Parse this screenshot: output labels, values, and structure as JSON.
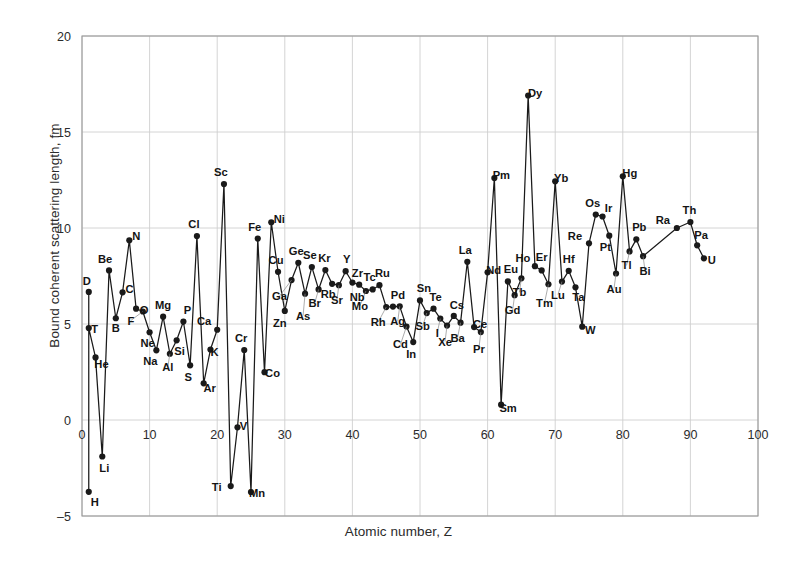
{
  "chart_data": {
    "type": "line",
    "title": "",
    "xlabel": "Atomic number, Z",
    "ylabel": "Bound coherent scattering length, fm",
    "xlim": [
      0,
      100
    ],
    "ylim": [
      -5,
      20
    ],
    "xticks": [
      0,
      10,
      20,
      30,
      40,
      50,
      60,
      70,
      80,
      90,
      100
    ],
    "yticks": [
      -5,
      0,
      5,
      10,
      15,
      20
    ],
    "grid": true,
    "legend": "none",
    "marker": "filled-circle",
    "line_color": "#1a1a1a",
    "grid_color": "#cfcfcf",
    "axis_color": "#9a9a9a",
    "series": [
      {
        "name": "Bound coherent scattering length",
        "points": [
          {
            "label": "H",
            "x": 1,
            "y": -3.74,
            "lx": 6,
            "ly": 14
          },
          {
            "label": "D",
            "x": 1,
            "y": 6.67,
            "lx": -2,
            "ly": -7
          },
          {
            "label": "T",
            "x": 1,
            "y": 4.79,
            "lx": 6,
            "ly": 5
          },
          {
            "label": "He",
            "x": 2,
            "y": 3.26,
            "lx": 6,
            "ly": 11
          },
          {
            "label": "Li",
            "x": 3,
            "y": -1.9,
            "lx": 2,
            "ly": 16
          },
          {
            "label": "Be",
            "x": 4,
            "y": 7.79,
            "lx": -4,
            "ly": -7
          },
          {
            "label": "B",
            "x": 5,
            "y": 5.3,
            "lx": 0,
            "ly": 14
          },
          {
            "label": "C",
            "x": 6,
            "y": 6.65,
            "lx": 7,
            "ly": 1
          },
          {
            "label": "N",
            "x": 7,
            "y": 9.36,
            "lx": 7,
            "ly": 0
          },
          {
            "label": "O",
            "x": 8,
            "y": 5.8,
            "lx": 8,
            "ly": 5
          },
          {
            "label": "F",
            "x": 9,
            "y": 5.65,
            "lx": -12,
            "ly": 13
          },
          {
            "label": "Ne",
            "x": 10,
            "y": 4.57,
            "lx": -2,
            "ly": 15
          },
          {
            "label": "Na",
            "x": 11,
            "y": 3.63,
            "lx": -6,
            "ly": 15
          },
          {
            "label": "Mg",
            "x": 12,
            "y": 5.38,
            "lx": 0,
            "ly": -8
          },
          {
            "label": "Al",
            "x": 13,
            "y": 3.45,
            "lx": -2,
            "ly": 17
          },
          {
            "label": "Si",
            "x": 14,
            "y": 4.15,
            "lx": 3,
            "ly": 15
          },
          {
            "label": "P",
            "x": 15,
            "y": 5.13,
            "lx": 4,
            "ly": -8
          },
          {
            "label": "S",
            "x": 16,
            "y": 2.85,
            "lx": -2,
            "ly": 16
          },
          {
            "label": "Cl",
            "x": 17,
            "y": 9.58,
            "lx": -3,
            "ly": -8
          },
          {
            "label": "Ar",
            "x": 18,
            "y": 1.91,
            "lx": 6,
            "ly": 9
          },
          {
            "label": "K",
            "x": 19,
            "y": 3.67,
            "lx": 4,
            "ly": 6
          },
          {
            "label": "Ca",
            "x": 20,
            "y": 4.7,
            "lx": -13,
            "ly": -5
          },
          {
            "label": "Sc",
            "x": 21,
            "y": 12.29,
            "lx": -3,
            "ly": -8
          },
          {
            "label": "Ti",
            "x": 22,
            "y": -3.44,
            "lx": -14,
            "ly": 5
          },
          {
            "label": "V",
            "x": 23,
            "y": -0.38,
            "lx": 6,
            "ly": 3
          },
          {
            "label": "Cr",
            "x": 24,
            "y": 3.64,
            "lx": -3,
            "ly": -8
          },
          {
            "label": "Mn",
            "x": 25,
            "y": -3.75,
            "lx": 6,
            "ly": 5
          },
          {
            "label": "Fe",
            "x": 26,
            "y": 9.45,
            "lx": -3,
            "ly": -8
          },
          {
            "label": "Co",
            "x": 27,
            "y": 2.49,
            "lx": 8,
            "ly": 5
          },
          {
            "label": "Ni",
            "x": 28,
            "y": 10.3,
            "lx": 8,
            "ly": 1
          },
          {
            "label": "Cu",
            "x": 29,
            "y": 7.72,
            "lx": -2,
            "ly": -8
          },
          {
            "label": "Zn",
            "x": 30,
            "y": 5.68,
            "lx": -5,
            "ly": 16
          },
          {
            "label": "Ga",
            "x": 31,
            "y": 7.29,
            "lx": -12,
            "ly": 20
          },
          {
            "label": "Ge",
            "x": 32,
            "y": 8.19,
            "lx": -2,
            "ly": -8
          },
          {
            "label": "As",
            "x": 33,
            "y": 6.58,
            "lx": -2,
            "ly": 26
          },
          {
            "label": "Se",
            "x": 34,
            "y": 7.97,
            "lx": -2,
            "ly": -8
          },
          {
            "label": "Br",
            "x": 35,
            "y": 6.8,
            "lx": -4,
            "ly": 18
          },
          {
            "label": "Kr",
            "x": 36,
            "y": 7.81,
            "lx": -1,
            "ly": -8
          },
          {
            "label": "Rb",
            "x": 37,
            "y": 7.09,
            "lx": -4,
            "ly": 14
          },
          {
            "label": "Sr",
            "x": 38,
            "y": 7.02,
            "lx": -2,
            "ly": 19
          },
          {
            "label": "Y",
            "x": 39,
            "y": 7.75,
            "lx": 1,
            "ly": -8
          },
          {
            "label": "Zr",
            "x": 40,
            "y": 7.16,
            "lx": 5,
            "ly": -6
          },
          {
            "label": "Nb",
            "x": 41,
            "y": 7.05,
            "lx": -2,
            "ly": 16
          },
          {
            "label": "Mo",
            "x": 42,
            "y": 6.72,
            "lx": -6,
            "ly": 19
          },
          {
            "label": "Tc",
            "x": 43,
            "y": 6.8,
            "lx": -3,
            "ly": -8
          },
          {
            "label": "Ru",
            "x": 44,
            "y": 7.02,
            "lx": 3,
            "ly": -8
          },
          {
            "label": "Rh",
            "x": 45,
            "y": 5.88,
            "lx": -8,
            "ly": 19
          },
          {
            "label": "Pd",
            "x": 46,
            "y": 5.91,
            "lx": 5,
            "ly": -8
          },
          {
            "label": "Ag",
            "x": 47,
            "y": 5.92,
            "lx": -2,
            "ly": 19
          },
          {
            "label": "Cd",
            "x": 48,
            "y": 4.87,
            "lx": -6,
            "ly": 22
          },
          {
            "label": "In",
            "x": 49,
            "y": 4.06,
            "lx": -2,
            "ly": 16
          },
          {
            "label": "Sn",
            "x": 50,
            "y": 6.23,
            "lx": 4,
            "ly": -8
          },
          {
            "label": "Sb",
            "x": 51,
            "y": 5.57,
            "lx": -4,
            "ly": 17
          },
          {
            "label": "Te",
            "x": 52,
            "y": 5.8,
            "lx": 2,
            "ly": -8
          },
          {
            "label": "I",
            "x": 53,
            "y": 5.28,
            "lx": -3,
            "ly": 18
          },
          {
            "label": "Xe",
            "x": 54,
            "y": 4.92,
            "lx": -2,
            "ly": 20
          },
          {
            "label": "Cs",
            "x": 55,
            "y": 5.42,
            "lx": 3,
            "ly": -7
          },
          {
            "label": "Ba",
            "x": 56,
            "y": 5.07,
            "lx": -3,
            "ly": 19
          },
          {
            "label": "La",
            "x": 57,
            "y": 8.24,
            "lx": -2,
            "ly": -8
          },
          {
            "label": "Ce",
            "x": 58,
            "y": 4.84,
            "lx": 6,
            "ly": 1
          },
          {
            "label": "Pr",
            "x": 59,
            "y": 4.58,
            "lx": -2,
            "ly": 21
          },
          {
            "label": "Nd",
            "x": 60,
            "y": 7.69,
            "lx": 6,
            "ly": 2
          },
          {
            "label": "Pm",
            "x": 61,
            "y": 12.6,
            "lx": 7,
            "ly": 1
          },
          {
            "label": "Sm",
            "x": 62,
            "y": 0.8,
            "lx": 7,
            "ly": 7
          },
          {
            "label": "Eu",
            "x": 63,
            "y": 7.22,
            "lx": 3,
            "ly": -8
          },
          {
            "label": "Gd",
            "x": 64,
            "y": 6.5,
            "lx": -2,
            "ly": 19
          },
          {
            "label": "Tb",
            "x": 65,
            "y": 7.38,
            "lx": -2,
            "ly": 18
          },
          {
            "label": "Dy",
            "x": 66,
            "y": 16.9,
            "lx": 7,
            "ly": 1
          },
          {
            "label": "Ho",
            "x": 67,
            "y": 8.01,
            "lx": -12,
            "ly": -4
          },
          {
            "label": "Er",
            "x": 68,
            "y": 7.79,
            "lx": 0,
            "ly": -9
          },
          {
            "label": "Tm",
            "x": 69,
            "y": 7.07,
            "lx": -4,
            "ly": 23
          },
          {
            "label": "Yb",
            "x": 70,
            "y": 12.43,
            "lx": 6,
            "ly": 1
          },
          {
            "label": "Lu",
            "x": 71,
            "y": 7.21,
            "lx": -4,
            "ly": 17
          },
          {
            "label": "Hf",
            "x": 72,
            "y": 7.77,
            "lx": 0,
            "ly": -8
          },
          {
            "label": "Ta",
            "x": 73,
            "y": 6.91,
            "lx": 3,
            "ly": 14
          },
          {
            "label": "W",
            "x": 74,
            "y": 4.86,
            "lx": 8,
            "ly": 7
          },
          {
            "label": "Re",
            "x": 75,
            "y": 9.2,
            "lx": -14,
            "ly": -3
          },
          {
            "label": "Os",
            "x": 76,
            "y": 10.7,
            "lx": -3,
            "ly": -8
          },
          {
            "label": "Ir",
            "x": 77,
            "y": 10.6,
            "lx": 6,
            "ly": -4
          },
          {
            "label": "Pt",
            "x": 78,
            "y": 9.6,
            "lx": -4,
            "ly": 15
          },
          {
            "label": "Au",
            "x": 79,
            "y": 7.63,
            "lx": -2,
            "ly": 19
          },
          {
            "label": "Hg",
            "x": 80,
            "y": 12.69,
            "lx": 7,
            "ly": 1
          },
          {
            "label": "Tl",
            "x": 81,
            "y": 8.78,
            "lx": -3,
            "ly": 18
          },
          {
            "label": "Pb",
            "x": 82,
            "y": 9.41,
            "lx": 3,
            "ly": -8
          },
          {
            "label": "Bi",
            "x": 83,
            "y": 8.53,
            "lx": 2,
            "ly": 19
          },
          {
            "label": "Ra",
            "x": 88,
            "y": 10.0,
            "lx": -14,
            "ly": -4
          },
          {
            "label": "Th",
            "x": 90,
            "y": 10.31,
            "lx": -1,
            "ly": -8
          },
          {
            "label": "Pa",
            "x": 91,
            "y": 9.1,
            "lx": 4,
            "ly": -6
          },
          {
            "label": "U",
            "x": 92,
            "y": 8.42,
            "lx": 8,
            "ly": 6
          }
        ]
      }
    ]
  },
  "axes": {
    "x_title": "Atomic number, Z",
    "y_title": "Bound coherent scattering length, fm",
    "x_tick_labels": [
      "0",
      "10",
      "20",
      "30",
      "40",
      "50",
      "60",
      "70",
      "80",
      "90",
      "100"
    ],
    "y_tick_labels": [
      "20",
      "15",
      "10",
      "5",
      "0",
      "–5"
    ]
  }
}
